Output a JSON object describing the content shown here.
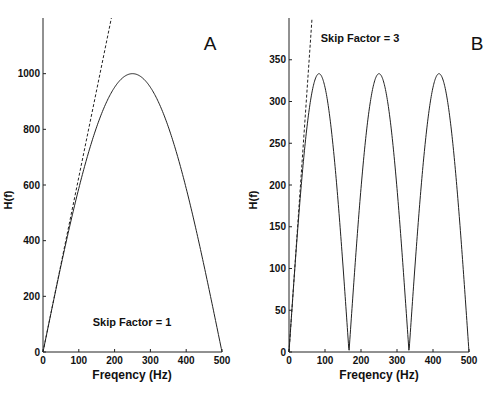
{
  "chart_data": [
    {
      "type": "line",
      "panel_label": "A",
      "annotation": "Skip Factor = 1",
      "title": "",
      "xlabel": "Freqency (Hz)",
      "ylabel": "H(f)",
      "xlim": [
        0,
        500
      ],
      "ylim": [
        0,
        1200
      ],
      "x_ticks": [
        0,
        100,
        200,
        300,
        400,
        500
      ],
      "y_ticks": [
        0,
        200,
        400,
        600,
        800,
        1000
      ],
      "grid": false,
      "series": [
        {
          "name": "H(f) solid",
          "style": "solid",
          "x": [
            0,
            50,
            100,
            150,
            200,
            250,
            300,
            350,
            400,
            450,
            500
          ],
          "values": [
            0,
            309,
            588,
            809,
            951,
            1000,
            951,
            809,
            588,
            309,
            0
          ]
        },
        {
          "name": "2*pi*f dashed",
          "style": "dashed",
          "x": [
            0,
            50,
            100,
            150,
            191
          ],
          "values": [
            0,
            314,
            628,
            942,
            1200
          ]
        }
      ]
    },
    {
      "type": "line",
      "panel_label": "B",
      "annotation": "Skip Factor = 3",
      "title": "",
      "xlabel": "Freqency (Hz)",
      "ylabel": "H(f)",
      "xlim": [
        0,
        500
      ],
      "ylim": [
        0,
        400
      ],
      "x_ticks": [
        0,
        100,
        200,
        300,
        400,
        500
      ],
      "y_ticks": [
        0,
        50,
        100,
        150,
        200,
        250,
        300,
        350
      ],
      "grid": false,
      "series": [
        {
          "name": "H(f) solid",
          "style": "solid",
          "x": [
            0,
            83.3,
            166.7,
            250,
            333.3,
            416.7,
            500
          ],
          "values": [
            0,
            333,
            0,
            333,
            0,
            333,
            0
          ]
        },
        {
          "name": "2*pi*f dashed",
          "style": "dashed",
          "x": [
            0,
            30,
            64
          ],
          "values": [
            0,
            188,
            400
          ]
        }
      ]
    }
  ]
}
